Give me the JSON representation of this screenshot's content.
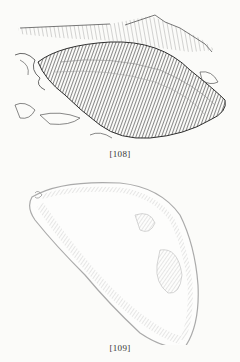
{
  "figures": [
    {
      "caption": "[108]",
      "subject": "mussel shell, exterior view, lying on shore with rocks and seaweed"
    },
    {
      "caption": "[109]",
      "subject": "mussel shell, interior view of single valve"
    }
  ],
  "colors": {
    "paper": "#fbfbf9",
    "ink_dark": "#3a3a3a",
    "ink_light": "#b5b5b5"
  }
}
